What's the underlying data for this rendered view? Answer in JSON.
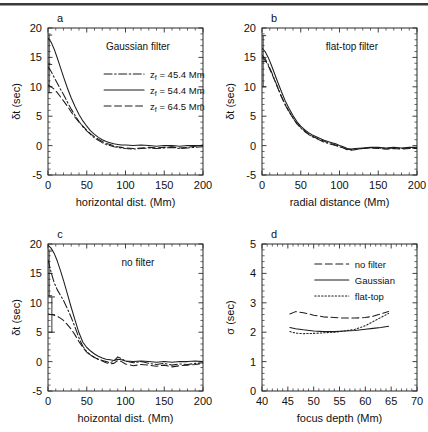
{
  "figure": {
    "background": "#ffffff",
    "ink": "#1d1d1d",
    "panels": [
      "a",
      "b",
      "c",
      "d"
    ]
  },
  "chart_data": [
    {
      "type": "line",
      "panel": "a",
      "panel_label": "a",
      "title": "",
      "annotation": "Gaussian filter",
      "xlabel": "horizontal dist. (Mm)",
      "ylabel": "δt (sec)",
      "xlim": [
        0,
        200
      ],
      "ylim": [
        -5,
        20
      ],
      "xticks": [
        0,
        50,
        100,
        150,
        200
      ],
      "yticks": [
        -5,
        0,
        5,
        10,
        15,
        20
      ],
      "grid": false,
      "legend_position": "upper-right",
      "legend": [
        "z_f = 45.4 Mm",
        "z_f = 54.4 Mm",
        "z_f = 64.5 Mm"
      ],
      "errorbars": [
        {
          "x": 1.5,
          "y": 13.8,
          "ylow": 9.0,
          "yhigh": 18.8
        }
      ],
      "series": [
        {
          "name": "z_f = 45.4 Mm",
          "label": "zf = 45.4 Mm",
          "dash": "dashdot",
          "x": [
            0,
            4,
            8,
            12,
            16,
            20,
            25,
            30,
            35,
            40,
            45,
            50,
            55,
            60,
            65,
            70,
            75,
            80,
            85,
            90,
            95,
            100,
            110,
            120,
            130,
            140,
            150,
            160,
            170,
            180,
            190,
            200
          ],
          "values": [
            13.4,
            12.6,
            11.6,
            10.6,
            9.6,
            8.7,
            7.4,
            6.2,
            5.1,
            4.1,
            3.2,
            2.5,
            1.9,
            1.3,
            0.9,
            0.5,
            0.2,
            0.0,
            -0.2,
            -0.3,
            -0.4,
            -0.5,
            -0.6,
            -0.5,
            -0.4,
            -0.5,
            -0.4,
            -0.3,
            -0.5,
            -0.4,
            -0.3,
            -0.2
          ]
        },
        {
          "name": "z_f = 54.4 Mm",
          "label": "zf = 54.4 Mm",
          "dash": "solid",
          "x": [
            0,
            4,
            8,
            12,
            16,
            20,
            25,
            30,
            35,
            40,
            45,
            50,
            55,
            60,
            65,
            70,
            75,
            80,
            85,
            90,
            95,
            100,
            110,
            120,
            130,
            140,
            150,
            160,
            170,
            180,
            190,
            200
          ],
          "values": [
            18.3,
            17.6,
            16.4,
            14.9,
            13.3,
            11.7,
            9.8,
            8.1,
            6.6,
            5.3,
            4.2,
            3.3,
            2.5,
            1.9,
            1.4,
            1.0,
            0.7,
            0.5,
            0.3,
            0.2,
            0.1,
            0.1,
            0.0,
            0.1,
            0.0,
            -0.1,
            0.0,
            0.0,
            -0.1,
            0.0,
            0.0,
            0.0
          ]
        },
        {
          "name": "z_f = 64.5 Mm",
          "label": "zf = 64.5 Mm",
          "dash": "dashed",
          "x": [
            0,
            4,
            8,
            12,
            16,
            20,
            25,
            30,
            35,
            40,
            45,
            50,
            55,
            60,
            65,
            70,
            75,
            80,
            85,
            90,
            95,
            100,
            110,
            120,
            130,
            140,
            150,
            160,
            170,
            180,
            190,
            200
          ],
          "values": [
            10.3,
            10.0,
            9.6,
            9.0,
            8.3,
            7.6,
            6.7,
            5.7,
            4.8,
            4.0,
            3.3,
            2.6,
            2.0,
            1.5,
            1.1,
            0.7,
            0.4,
            0.2,
            0.0,
            -0.2,
            -0.3,
            -0.4,
            -0.5,
            -0.4,
            -0.3,
            -0.4,
            -0.3,
            -0.2,
            -0.4,
            -0.3,
            -0.1,
            0.1
          ]
        }
      ]
    },
    {
      "type": "line",
      "panel": "b",
      "panel_label": "b",
      "title": "",
      "annotation": "flat-top filter",
      "xlabel": "radial distance (Mm)",
      "ylabel": "δt (sec)",
      "xlim": [
        0,
        200
      ],
      "ylim": [
        -5,
        20
      ],
      "xticks": [
        0,
        50,
        100,
        150,
        200
      ],
      "yticks": [
        -5,
        0,
        5,
        10,
        15,
        20
      ],
      "grid": false,
      "legend_position": "none",
      "legend": [],
      "errorbars": [
        {
          "x": 1.5,
          "y": 14.3,
          "ylow": 10.0,
          "yhigh": 18.7
        }
      ],
      "series": [
        {
          "name": "z_f = 45.4 Mm",
          "label": "",
          "dash": "dashdot",
          "x": [
            0,
            4,
            8,
            12,
            16,
            20,
            25,
            30,
            35,
            40,
            45,
            50,
            55,
            60,
            65,
            70,
            75,
            80,
            85,
            90,
            95,
            100,
            105,
            110,
            115,
            120,
            130,
            140,
            150,
            160,
            170,
            180,
            190,
            200
          ],
          "values": [
            15.4,
            14.8,
            13.8,
            12.6,
            11.3,
            10.0,
            8.4,
            7.0,
            5.8,
            4.7,
            3.7,
            3.0,
            2.4,
            1.9,
            1.5,
            1.2,
            0.9,
            0.6,
            0.4,
            0.2,
            0.0,
            -0.2,
            -0.4,
            -0.6,
            -0.7,
            -0.6,
            -0.5,
            -0.4,
            -0.4,
            -0.5,
            -0.4,
            -0.5,
            -0.4,
            -0.4
          ]
        },
        {
          "name": "z_f = 54.4 Mm",
          "label": "",
          "dash": "solid",
          "x": [
            0,
            4,
            8,
            12,
            16,
            20,
            25,
            30,
            35,
            40,
            45,
            50,
            55,
            60,
            65,
            70,
            75,
            80,
            85,
            90,
            95,
            100,
            105,
            110,
            115,
            120,
            130,
            140,
            150,
            160,
            170,
            180,
            190,
            200
          ],
          "values": [
            16.6,
            16.0,
            15.0,
            13.7,
            12.3,
            10.9,
            9.2,
            7.6,
            6.3,
            5.1,
            4.1,
            3.3,
            2.7,
            2.2,
            1.8,
            1.5,
            1.2,
            0.9,
            0.7,
            0.5,
            0.3,
            0.0,
            -0.2,
            -0.5,
            -0.6,
            -0.5,
            -0.4,
            -0.3,
            -0.3,
            -0.4,
            -0.3,
            -0.4,
            -0.3,
            -0.3
          ]
        },
        {
          "name": "z_f = 64.5 Mm",
          "label": "",
          "dash": "dashed",
          "x": [
            0,
            4,
            8,
            12,
            16,
            20,
            25,
            30,
            35,
            40,
            45,
            50,
            55,
            60,
            65,
            70,
            75,
            80,
            85,
            90,
            95,
            100,
            105,
            110,
            115,
            120,
            130,
            140,
            150,
            160,
            170,
            180,
            190,
            200
          ],
          "values": [
            15.0,
            14.5,
            13.6,
            12.4,
            11.2,
            9.9,
            8.3,
            6.9,
            5.7,
            4.7,
            3.8,
            3.1,
            2.5,
            2.0,
            1.6,
            1.3,
            1.0,
            0.8,
            0.5,
            0.3,
            0.1,
            -0.1,
            -0.4,
            -0.7,
            -0.8,
            -0.7,
            -0.5,
            -0.4,
            -0.5,
            -0.6,
            -0.5,
            -0.6,
            -0.5,
            -0.5
          ]
        }
      ]
    },
    {
      "type": "line",
      "panel": "c",
      "panel_label": "c",
      "title": "",
      "annotation": "no filter",
      "xlabel": "hoizontal dist. (Mm)",
      "ylabel": "δt (sec)",
      "xlim": [
        0,
        200
      ],
      "ylim": [
        -5,
        20
      ],
      "xticks": [
        0,
        50,
        100,
        150,
        200
      ],
      "yticks": [
        -5,
        0,
        5,
        10,
        15,
        20
      ],
      "grid": false,
      "legend_position": "none",
      "legend": [],
      "errorbars": [
        {
          "x": 1.5,
          "y": 15.0,
          "ylow": 11.2,
          "yhigh": 18.8
        },
        {
          "x": 5.0,
          "y": 8.0,
          "ylow": 5.0,
          "yhigh": 11.0
        }
      ],
      "series": [
        {
          "name": "z_f = 45.4 Mm",
          "label": "",
          "dash": "dashdot",
          "x": [
            0,
            4,
            8,
            12,
            16,
            20,
            25,
            30,
            35,
            40,
            45,
            50,
            55,
            60,
            65,
            70,
            75,
            80,
            85,
            90,
            95,
            100,
            110,
            120,
            130,
            140,
            150,
            160,
            170,
            180,
            190,
            200
          ],
          "values": [
            17.3,
            15.2,
            13.4,
            12.2,
            11.3,
            10.4,
            9.0,
            7.5,
            5.8,
            4.0,
            2.6,
            1.7,
            1.1,
            0.7,
            0.4,
            0.2,
            0.0,
            -0.2,
            0.1,
            0.8,
            0.5,
            0.1,
            -0.2,
            0.0,
            -0.3,
            -0.5,
            -0.3,
            -0.6,
            -0.4,
            -0.5,
            -0.3,
            -0.2
          ]
        },
        {
          "name": "z_f = 54.4 Mm",
          "label": "",
          "dash": "solid",
          "x": [
            0,
            4,
            8,
            12,
            16,
            20,
            25,
            30,
            35,
            40,
            45,
            50,
            55,
            60,
            65,
            70,
            75,
            80,
            85,
            90,
            95,
            100,
            110,
            120,
            130,
            140,
            150,
            160,
            170,
            180,
            190,
            200
          ],
          "values": [
            19.8,
            19.3,
            18.4,
            17.1,
            15.5,
            13.8,
            11.5,
            9.2,
            7.0,
            4.9,
            3.3,
            2.4,
            1.8,
            1.3,
            0.9,
            0.6,
            0.4,
            0.3,
            0.2,
            0.4,
            0.3,
            0.1,
            0.0,
            0.1,
            0.0,
            -0.1,
            0.0,
            -0.1,
            0.0,
            0.0,
            0.1,
            0.0
          ]
        },
        {
          "name": "z_f = 64.5 Mm",
          "label": "",
          "dash": "dashed",
          "x": [
            0,
            4,
            8,
            12,
            16,
            20,
            25,
            30,
            35,
            40,
            45,
            50,
            55,
            60,
            65,
            70,
            75,
            80,
            85,
            90,
            95,
            100,
            110,
            120,
            130,
            140,
            150,
            160,
            170,
            180,
            190,
            200
          ],
          "values": [
            8.1,
            8.0,
            7.9,
            7.7,
            7.4,
            7.0,
            6.3,
            5.5,
            4.5,
            3.4,
            2.4,
            1.6,
            1.1,
            0.7,
            0.4,
            0.1,
            -0.2,
            -0.4,
            -0.3,
            0.2,
            0.0,
            -0.4,
            -0.7,
            -0.5,
            -0.6,
            -0.8,
            -0.6,
            -0.9,
            -0.7,
            -0.6,
            -0.5,
            -0.3
          ]
        }
      ]
    },
    {
      "type": "line",
      "panel": "d",
      "panel_label": "d",
      "title": "",
      "annotation": "",
      "xlabel": "focus depth (Mm)",
      "ylabel": "σ (sec)",
      "xlim": [
        40,
        70
      ],
      "ylim": [
        0,
        5
      ],
      "xticks": [
        40,
        45,
        50,
        55,
        60,
        65,
        70
      ],
      "yticks": [
        0,
        1,
        2,
        3,
        4,
        5
      ],
      "grid": false,
      "legend_position": "upper-right",
      "legend": [
        "no filter",
        "Gaussian",
        "flat-top"
      ],
      "errorbars": [],
      "series": [
        {
          "name": "no filter",
          "label": "no filter",
          "dash": "dashed",
          "x": [
            45.4,
            46.5,
            48,
            50,
            52,
            54,
            56,
            58,
            60,
            61.5,
            63,
            64.5
          ],
          "values": [
            2.62,
            2.7,
            2.66,
            2.58,
            2.52,
            2.5,
            2.48,
            2.48,
            2.5,
            2.54,
            2.62,
            2.7
          ]
        },
        {
          "name": "Gaussian",
          "label": "Gaussian",
          "dash": "solid",
          "x": [
            45.4,
            46.5,
            48,
            50,
            52,
            54,
            56,
            58,
            60,
            61.5,
            63,
            64.5
          ],
          "values": [
            2.16,
            2.12,
            2.08,
            2.04,
            2.02,
            2.02,
            2.04,
            2.06,
            2.1,
            2.13,
            2.16,
            2.2
          ]
        },
        {
          "name": "flat-top",
          "label": "flat-top",
          "dash": "dotted",
          "x": [
            45.4,
            46.5,
            48,
            50,
            52,
            54,
            56,
            58,
            60,
            61.5,
            63,
            64.5
          ],
          "values": [
            2.02,
            1.97,
            1.95,
            1.96,
            1.98,
            2.0,
            2.04,
            2.1,
            2.22,
            2.36,
            2.5,
            2.64
          ]
        }
      ]
    }
  ]
}
